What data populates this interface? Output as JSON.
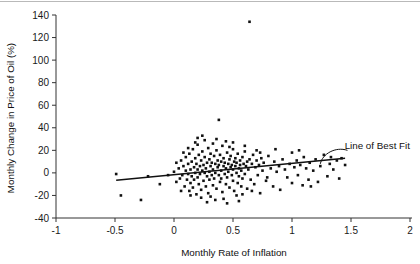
{
  "chart_data": {
    "type": "scatter",
    "title": "",
    "xlabel": "Monthly Rate of Inflation",
    "ylabel": "Monthly Change in Price of Oil (%)",
    "xlim": [
      -1,
      2
    ],
    "ylim": [
      -40,
      140
    ],
    "xticks": [
      -1,
      -0.5,
      0,
      0.5,
      1,
      1.5,
      2
    ],
    "xtick_labels": [
      "-1",
      "-0.5",
      "0",
      "0.5",
      "1",
      "1.5",
      "2"
    ],
    "yticks": [
      -40,
      -20,
      0,
      20,
      40,
      60,
      80,
      100,
      120,
      140
    ],
    "ytick_labels": [
      "-40",
      "-20",
      "0",
      "20",
      "40",
      "60",
      "80",
      "100",
      "120",
      "140"
    ],
    "grid": false,
    "legend": null,
    "marker": "filled-square",
    "marker_color": "#111111",
    "marker_size_px": 2.6,
    "annotations": [
      {
        "text": "Line of Best Fit",
        "x": 1.48,
        "y": 24,
        "leader_from": [
          1.24,
          8
        ],
        "leader_to": [
          1.47,
          20
        ]
      }
    ],
    "series": [
      {
        "name": "Monthly observations",
        "color": "#111111",
        "points": [
          [
            -0.49,
            -1
          ],
          [
            -0.45,
            -20
          ],
          [
            -0.28,
            -24
          ],
          [
            -0.22,
            -3
          ],
          [
            -0.12,
            -10
          ],
          [
            -0.05,
            -2
          ],
          [
            0.0,
            1
          ],
          [
            0.02,
            -8
          ],
          [
            0.04,
            4
          ],
          [
            0.05,
            -5
          ],
          [
            0.06,
            11
          ],
          [
            0.07,
            -2
          ],
          [
            0.08,
            6
          ],
          [
            0.09,
            -12
          ],
          [
            0.1,
            2
          ],
          [
            0.1,
            14
          ],
          [
            0.11,
            -6
          ],
          [
            0.12,
            8
          ],
          [
            0.12,
            -1
          ],
          [
            0.13,
            17
          ],
          [
            0.13,
            -16
          ],
          [
            0.14,
            3
          ],
          [
            0.14,
            -9
          ],
          [
            0.15,
            10
          ],
          [
            0.15,
            -3
          ],
          [
            0.16,
            21
          ],
          [
            0.16,
            -13
          ],
          [
            0.17,
            5
          ],
          [
            0.17,
            -6
          ],
          [
            0.18,
            13
          ],
          [
            0.18,
            0
          ],
          [
            0.19,
            -19
          ],
          [
            0.19,
            8
          ],
          [
            0.2,
            25
          ],
          [
            0.2,
            -4
          ],
          [
            0.2,
            3
          ],
          [
            0.21,
            16
          ],
          [
            0.21,
            -10
          ],
          [
            0.22,
            6
          ],
          [
            0.22,
            -1
          ],
          [
            0.23,
            11
          ],
          [
            0.23,
            -15
          ],
          [
            0.24,
            2
          ],
          [
            0.24,
            19
          ],
          [
            0.25,
            -7
          ],
          [
            0.25,
            7
          ],
          [
            0.26,
            0
          ],
          [
            0.26,
            14
          ],
          [
            0.27,
            -12
          ],
          [
            0.27,
            4
          ],
          [
            0.28,
            9
          ],
          [
            0.28,
            -3
          ],
          [
            0.29,
            22
          ],
          [
            0.29,
            -18
          ],
          [
            0.3,
            1
          ],
          [
            0.3,
            12
          ],
          [
            0.3,
            -6
          ],
          [
            0.31,
            6
          ],
          [
            0.31,
            17
          ],
          [
            0.32,
            -2
          ],
          [
            0.32,
            9
          ],
          [
            0.33,
            -11
          ],
          [
            0.33,
            3
          ],
          [
            0.34,
            15
          ],
          [
            0.34,
            -5
          ],
          [
            0.35,
            8
          ],
          [
            0.35,
            0
          ],
          [
            0.36,
            20
          ],
          [
            0.36,
            -14
          ],
          [
            0.37,
            5
          ],
          [
            0.37,
            11
          ],
          [
            0.38,
            -2
          ],
          [
            0.38,
            7
          ],
          [
            0.39,
            -8
          ],
          [
            0.39,
            16
          ],
          [
            0.4,
            2
          ],
          [
            0.4,
            10
          ],
          [
            0.4,
            -5
          ],
          [
            0.41,
            24
          ],
          [
            0.41,
            -17
          ],
          [
            0.42,
            6
          ],
          [
            0.42,
            13
          ],
          [
            0.43,
            -1
          ],
          [
            0.43,
            9
          ],
          [
            0.44,
            -10
          ],
          [
            0.44,
            4
          ],
          [
            0.45,
            18
          ],
          [
            0.45,
            -4
          ],
          [
            0.46,
            8
          ],
          [
            0.46,
            1
          ],
          [
            0.47,
            12
          ],
          [
            0.47,
            -13
          ],
          [
            0.48,
            5
          ],
          [
            0.48,
            15
          ],
          [
            0.49,
            -2
          ],
          [
            0.49,
            7
          ],
          [
            0.5,
            -7
          ],
          [
            0.5,
            21
          ],
          [
            0.5,
            3
          ],
          [
            0.51,
            10
          ],
          [
            0.51,
            -16
          ],
          [
            0.52,
            6
          ],
          [
            0.52,
            13
          ],
          [
            0.53,
            0
          ],
          [
            0.53,
            9
          ],
          [
            0.54,
            -9
          ],
          [
            0.54,
            17
          ],
          [
            0.55,
            4
          ],
          [
            0.55,
            -3
          ],
          [
            0.56,
            11
          ],
          [
            0.56,
            7
          ],
          [
            0.57,
            -12
          ],
          [
            0.57,
            2
          ],
          [
            0.58,
            14
          ],
          [
            0.58,
            -5
          ],
          [
            0.59,
            8
          ],
          [
            0.6,
            19
          ],
          [
            0.6,
            -1
          ],
          [
            0.61,
            6
          ],
          [
            0.62,
            -14
          ],
          [
            0.62,
            10
          ],
          [
            0.63,
            3
          ],
          [
            0.64,
            134
          ],
          [
            0.64,
            12
          ],
          [
            0.65,
            -6
          ],
          [
            0.66,
            8
          ],
          [
            0.67,
            16
          ],
          [
            0.68,
            -10
          ],
          [
            0.69,
            5
          ],
          [
            0.7,
            11
          ],
          [
            0.71,
            -2
          ],
          [
            0.72,
            7
          ],
          [
            0.73,
            -18
          ],
          [
            0.74,
            13
          ],
          [
            0.75,
            2
          ],
          [
            0.76,
            9
          ],
          [
            0.38,
            47
          ],
          [
            0.78,
            -7
          ],
          [
            0.8,
            15
          ],
          [
            0.82,
            4
          ],
          [
            0.84,
            -12
          ],
          [
            0.85,
            10
          ],
          [
            0.87,
            1
          ],
          [
            0.89,
            6
          ],
          [
            0.9,
            -15
          ],
          [
            0.92,
            12
          ],
          [
            0.94,
            3
          ],
          [
            0.96,
            -4
          ],
          [
            0.98,
            8
          ],
          [
            1.0,
            18
          ],
          [
            1.0,
            -9
          ],
          [
            1.02,
            5
          ],
          [
            1.04,
            11
          ],
          [
            1.05,
            -2
          ],
          [
            1.07,
            7
          ],
          [
            1.09,
            -11
          ],
          [
            1.1,
            14
          ],
          [
            1.12,
            4
          ],
          [
            1.14,
            -6
          ],
          [
            1.15,
            9
          ],
          [
            1.18,
            2
          ],
          [
            1.2,
            12
          ],
          [
            1.22,
            -8
          ],
          [
            1.24,
            6
          ],
          [
            1.27,
            16
          ],
          [
            1.3,
            -3
          ],
          [
            1.32,
            8
          ],
          [
            1.35,
            3
          ],
          [
            1.38,
            11
          ],
          [
            1.4,
            -5
          ],
          [
            1.42,
            13
          ],
          [
            1.45,
            7
          ],
          [
            0.18,
            27
          ],
          [
            0.26,
            29
          ],
          [
            0.33,
            26
          ],
          [
            0.44,
            28
          ],
          [
            0.23,
            -22
          ],
          [
            0.31,
            -21
          ],
          [
            0.42,
            -23
          ],
          [
            0.53,
            -20
          ],
          [
            0.08,
            18
          ],
          [
            0.14,
            -20
          ],
          [
            0.6,
            24
          ],
          [
            0.66,
            -16
          ],
          [
            0.12,
            22
          ],
          [
            0.35,
            -24
          ],
          [
            0.47,
            23
          ],
          [
            0.58,
            -19
          ],
          [
            0.2,
            31
          ],
          [
            0.28,
            -26
          ],
          [
            0.5,
            27
          ],
          [
            0.7,
            20
          ],
          [
            0.86,
            21
          ],
          [
            1.06,
            20
          ],
          [
            1.16,
            -12
          ],
          [
            1.33,
            14
          ],
          [
            0.02,
            9
          ],
          [
            0.06,
            -16
          ],
          [
            0.73,
            18
          ],
          [
            0.79,
            -4
          ],
          [
            0.24,
            33
          ],
          [
            0.36,
            30
          ],
          [
            0.45,
            -27
          ],
          [
            0.55,
            -25
          ]
        ]
      }
    ],
    "fit_line": {
      "name": "Line of Best Fit",
      "x_start": -0.49,
      "y_start": -6.5,
      "x_end": 1.45,
      "y_end": 13.0,
      "color": "#111111"
    }
  }
}
